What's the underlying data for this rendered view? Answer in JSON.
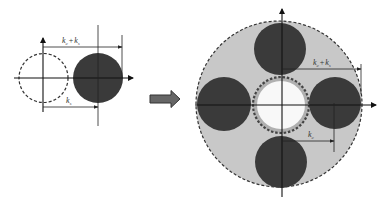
{
  "colors": {
    "background": "#ffffff",
    "dark_circle": "#3a3a3a",
    "ring_fill": "#c8c8c8",
    "inner_white": "#f8f8f8",
    "line": "#111111",
    "dashed": "#333333",
    "arrow_fill": "#666666",
    "arrow_stroke": "#333333"
  },
  "left_diagram": {
    "label_top": {
      "k1": "k",
      "k1_sub": "c",
      "plus": "+",
      "k2": "k",
      "k2_sub": "s"
    },
    "label_bottom": {
      "k": "k",
      "sub": "s"
    }
  },
  "transition_arrow": {
    "icon": "right-block-arrow"
  },
  "right_diagram": {
    "label_top": {
      "k1": "k",
      "k1_sub": "c",
      "plus": "+",
      "k2": "k",
      "k2_sub": "s"
    },
    "label_bottom": {
      "k": "k",
      "sub": "c"
    },
    "satellite_circles": [
      "top",
      "right",
      "bottom",
      "left"
    ]
  }
}
